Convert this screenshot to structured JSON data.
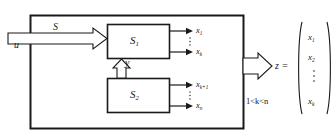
{
  "figure": {
    "type": "block-diagram"
  },
  "outer_system": {
    "name": "outer-system-boundary"
  },
  "input": {
    "signal_label": "u",
    "bus_label": "S"
  },
  "feedback": {
    "label": "y"
  },
  "blocks": [
    {
      "id": "s1",
      "label_base": "S",
      "label_sub": "1"
    },
    {
      "id": "s2",
      "label_base": "S",
      "label_sub": "2"
    }
  ],
  "outputs_upper": [
    {
      "base": "x",
      "sub": "1"
    },
    {
      "base": "x",
      "sub": "k"
    }
  ],
  "outputs_lower": [
    {
      "base": "x",
      "sub": "k+1"
    },
    {
      "base": "x",
      "sub": "n"
    }
  ],
  "output_bus": {
    "label": "z ="
  },
  "constraint": {
    "text_prefix": "1<",
    "var1": "k",
    "text_mid": "<",
    "var2": "n",
    "full": "1<k<n"
  },
  "vector": {
    "entries": [
      {
        "base": "x",
        "sub": "1"
      },
      {
        "base": "x",
        "sub": "2"
      },
      {
        "base": "x",
        "sub": "k"
      }
    ],
    "ellipsis": "vertical-dots"
  },
  "colors": {
    "stroke": "#1a1a1a",
    "background": "#ffffff"
  }
}
